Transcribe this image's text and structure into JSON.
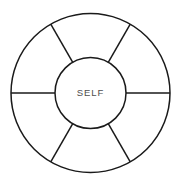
{
  "diagram": {
    "type": "segmented-wheel",
    "canvas": {
      "width": 182,
      "height": 186,
      "background": "#ffffff"
    },
    "style": {
      "stroke_color": "#1a1a1a",
      "stroke_width": 1.5,
      "fill": "none",
      "label_color": "#4d4d4d"
    },
    "geometry": {
      "center_x": 90.5,
      "center_y": 93,
      "outer_radius": 79.5,
      "inner_radius": 35.5,
      "segment_count": 6,
      "spoke_angles_deg": [
        0,
        60,
        120,
        180,
        240,
        300
      ]
    },
    "hub": {
      "label": "SELF",
      "radius": 35.5
    },
    "segments": [
      {
        "index": 1,
        "label": "",
        "start_angle_deg": 0,
        "end_angle_deg": 60
      },
      {
        "index": 2,
        "label": "",
        "start_angle_deg": 60,
        "end_angle_deg": 120
      },
      {
        "index": 3,
        "label": "",
        "start_angle_deg": 120,
        "end_angle_deg": 180
      },
      {
        "index": 4,
        "label": "",
        "start_angle_deg": 180,
        "end_angle_deg": 240
      },
      {
        "index": 5,
        "label": "",
        "start_angle_deg": 240,
        "end_angle_deg": 300
      },
      {
        "index": 6,
        "label": "",
        "start_angle_deg": 300,
        "end_angle_deg": 360
      }
    ]
  }
}
